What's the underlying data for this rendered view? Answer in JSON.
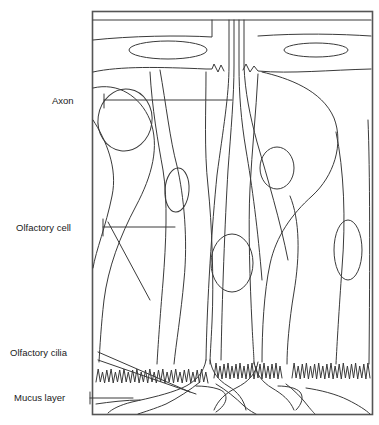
{
  "figure": {
    "kind": "biological-diagram",
    "background_color": "#ffffff",
    "stroke_color": "#3a3a3a",
    "frame_color": "#555555",
    "frame": {
      "x": 92,
      "y": 11,
      "width": 280,
      "height": 403
    }
  },
  "labels": [
    {
      "id": "axon",
      "text": "Axon",
      "text_x": 52,
      "text_y": 104,
      "leader": "horizontal",
      "from_x": 104,
      "to_x": 232,
      "y": 100
    },
    {
      "id": "olfactory-cell",
      "text": "Olfactory cell",
      "text_x": 16,
      "text_y": 231,
      "leader": "horizontal",
      "from_x": 103,
      "to_x": 175,
      "y": 227
    },
    {
      "id": "olfactory-cilia",
      "text": "Olfactory cilia",
      "text_x": 10,
      "text_y": 356,
      "leader": "double-diagonal"
    },
    {
      "id": "mucus-layer",
      "text": "Mucus layer",
      "text_x": 14,
      "text_y": 401,
      "leader": "horizontal",
      "from_x": 90,
      "to_x": 133,
      "y": 398
    }
  ],
  "regions": [
    {
      "name": "supporting-cell-band",
      "description": "upper band with elongated nuclei",
      "y_range": [
        20,
        72
      ]
    },
    {
      "name": "basal-layer",
      "description": "lower region with olfactory cell bodies",
      "y_range": [
        72,
        360
      ]
    },
    {
      "name": "cilia-layer",
      "description": "zigzag cilia fringe",
      "y_range": [
        358,
        390
      ]
    },
    {
      "name": "mucus-layer-region",
      "description": "dendritic knobs and mucus at base",
      "y_range": [
        385,
        414
      ]
    }
  ],
  "nuclei": [
    {
      "name": "upper-nucleus-left",
      "cx": 168,
      "cy": 50,
      "rx": 39,
      "ry": 9,
      "rot": 0
    },
    {
      "name": "upper-nucleus-right",
      "cx": 316,
      "cy": 50,
      "rx": 32,
      "ry": 7,
      "rot": 0
    },
    {
      "name": "cell-nucleus-left",
      "cx": 125,
      "cy": 120,
      "rx": 27,
      "ry": 31,
      "rot": 8
    },
    {
      "name": "cell-nucleus-mid-a",
      "cx": 177,
      "cy": 190,
      "rx": 12,
      "ry": 22,
      "rot": 4
    },
    {
      "name": "cell-nucleus-mid-b",
      "cx": 232,
      "cy": 263,
      "rx": 21,
      "ry": 29,
      "rot": 0
    },
    {
      "name": "cell-nucleus-right",
      "cx": 277,
      "cy": 168,
      "rx": 17,
      "ry": 21,
      "rot": 0
    },
    {
      "name": "cell-nucleus-far-right",
      "cx": 348,
      "cy": 250,
      "rx": 14,
      "ry": 30,
      "rot": 0
    }
  ],
  "cilia_segments": [
    {
      "name": "cilia-left",
      "x_start": 96,
      "x_end": 208,
      "baseline": 382,
      "amplitude": 11,
      "teeth": 26
    },
    {
      "name": "cilia-middle",
      "x_start": 214,
      "x_end": 282,
      "baseline": 378,
      "amplitude": 13,
      "teeth": 17
    },
    {
      "name": "cilia-right",
      "x_start": 292,
      "x_end": 370,
      "baseline": 378,
      "amplitude": 13,
      "teeth": 19
    }
  ]
}
